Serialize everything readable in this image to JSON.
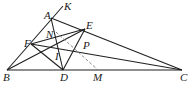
{
  "figure": {
    "type": "geometry-diagram",
    "points": {
      "A": {
        "label": "A",
        "x": 51,
        "y": 18
      },
      "K": {
        "label": "K",
        "x": 63,
        "y": 6
      },
      "B": {
        "label": "B",
        "x": 7,
        "y": 70
      },
      "C": {
        "label": "C",
        "x": 182,
        "y": 70
      },
      "D": {
        "label": "D",
        "x": 63,
        "y": 70
      },
      "M": {
        "label": "M",
        "x": 98,
        "y": 70
      },
      "E": {
        "label": "E",
        "x": 85,
        "y": 29
      },
      "F": {
        "label": "F",
        "x": 31,
        "y": 44
      },
      "I": {
        "label": "I",
        "x": 58,
        "y": 49
      },
      "P": {
        "label": "P",
        "x": 79,
        "y": 45
      },
      "N": {
        "label": "N",
        "x": 55,
        "y": 31
      }
    },
    "labels": [
      "A",
      "K",
      "B",
      "C",
      "D",
      "M",
      "E",
      "F",
      "I",
      "P",
      "N"
    ],
    "solid_segments": [
      [
        "B",
        "C"
      ],
      [
        "B",
        "K"
      ],
      [
        "A",
        "C"
      ],
      [
        "A",
        "D"
      ],
      [
        "B",
        "E"
      ],
      [
        "C",
        "F"
      ],
      [
        "F",
        "D"
      ],
      [
        "F",
        "E"
      ],
      [
        "E",
        "D"
      ]
    ],
    "dashed_segments": [
      [
        "N",
        "M"
      ]
    ]
  }
}
